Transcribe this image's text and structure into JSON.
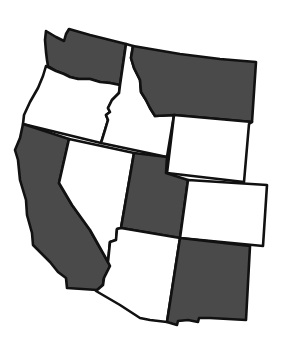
{
  "map": {
    "title": "Western United States",
    "colors": {
      "shaded": "#4a4a4a",
      "unshaded": "#ffffff",
      "border": "#111111"
    },
    "states": [
      {
        "id": "washington",
        "name": "Washington",
        "shaded": true
      },
      {
        "id": "oregon",
        "name": "Oregon",
        "shaded": false
      },
      {
        "id": "idaho",
        "name": "Idaho",
        "shaded": false
      },
      {
        "id": "montana",
        "name": "Montana",
        "shaded": true
      },
      {
        "id": "wyoming",
        "name": "Wyoming",
        "shaded": false
      },
      {
        "id": "california",
        "name": "California",
        "shaded": true
      },
      {
        "id": "nevada",
        "name": "Nevada",
        "shaded": false
      },
      {
        "id": "utah",
        "name": "Utah",
        "shaded": true
      },
      {
        "id": "colorado",
        "name": "Colorado",
        "shaded": false
      },
      {
        "id": "arizona",
        "name": "Arizona",
        "shaded": false
      },
      {
        "id": "new_mexico",
        "name": "New Mexico",
        "shaded": true
      }
    ]
  }
}
